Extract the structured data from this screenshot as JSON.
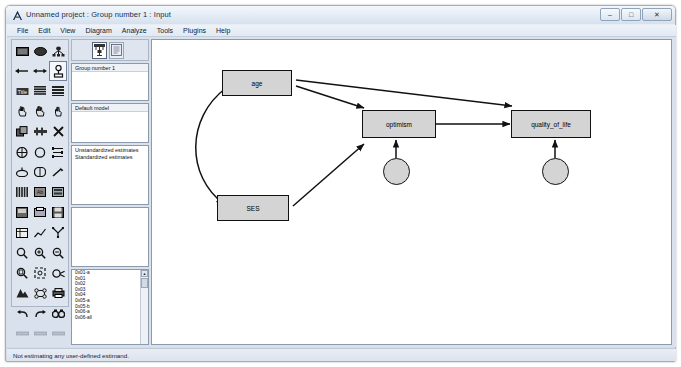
{
  "window": {
    "title": "Unnamed project : Group number 1 : Input",
    "icon": "amos-logo-icon",
    "minimize_label": "–",
    "maximize_label": "□",
    "close_label": "✕"
  },
  "menubar": {
    "items": [
      {
        "label": "File"
      },
      {
        "label": "Edit"
      },
      {
        "label": "View"
      },
      {
        "label": "Diagram"
      },
      {
        "label": "Analyze"
      },
      {
        "label": "Tools"
      },
      {
        "label": "Plugins"
      },
      {
        "label": "Help"
      }
    ]
  },
  "toolbox": {
    "tools": [
      {
        "name": "draw-observed-variable-icon",
        "selected": false
      },
      {
        "name": "draw-unobserved-variable-icon",
        "selected": false
      },
      {
        "name": "draw-latent-with-indicators-icon",
        "selected": false
      },
      {
        "name": "draw-path-icon",
        "selected": false
      },
      {
        "name": "draw-covariance-icon",
        "selected": false
      },
      {
        "name": "add-unique-variable-icon",
        "selected": true
      },
      {
        "name": "figure-caption-icon",
        "selected": false
      },
      {
        "name": "list-variables-in-model-icon",
        "selected": false
      },
      {
        "name": "list-variables-in-dataset-icon",
        "selected": false
      },
      {
        "name": "select-one-object-icon",
        "selected": false
      },
      {
        "name": "select-all-objects-icon",
        "selected": false
      },
      {
        "name": "deselect-all-objects-icon",
        "selected": false
      },
      {
        "name": "duplicate-objects-icon",
        "selected": false
      },
      {
        "name": "move-objects-icon",
        "selected": false
      },
      {
        "name": "erase-objects-icon",
        "selected": false
      },
      {
        "name": "change-shape-icon",
        "selected": false
      },
      {
        "name": "rotate-indicators-icon",
        "selected": false
      },
      {
        "name": "reflect-indicators-icon",
        "selected": false
      },
      {
        "name": "move-parameter-values-icon",
        "selected": false
      },
      {
        "name": "touch-up-variable-icon",
        "selected": false
      },
      {
        "name": "select-data-file-icon",
        "selected": false
      },
      {
        "name": "analysis-properties-icon",
        "selected": false
      },
      {
        "name": "object-properties-icon",
        "selected": false
      },
      {
        "name": "drag-properties-icon",
        "selected": false
      },
      {
        "name": "preserve-symmetries-icon",
        "selected": false
      },
      {
        "name": "zoom-icon",
        "selected": false
      },
      {
        "name": "zoom-in-icon",
        "selected": false
      },
      {
        "name": "zoom-out-icon",
        "selected": false
      },
      {
        "name": "zoom-page-icon",
        "selected": false
      },
      {
        "name": "fit-to-page-icon",
        "selected": false
      },
      {
        "name": "loupe-icon",
        "selected": false
      },
      {
        "name": "bayesian-estimation-icon",
        "selected": false
      },
      {
        "name": "multiple-group-analysis-icon",
        "selected": false
      },
      {
        "name": "print-icon",
        "selected": false
      },
      {
        "name": "undo-icon",
        "selected": false
      },
      {
        "name": "redo-icon",
        "selected": false
      },
      {
        "name": "search-icon",
        "selected": false
      }
    ]
  },
  "tree_panel": {
    "toolbar": {
      "buttons": [
        {
          "name": "view-input-path-diagram-button",
          "active": true
        },
        {
          "name": "view-output-path-diagram-button",
          "active": false
        }
      ]
    },
    "groups": {
      "items": [
        "Group number 1"
      ]
    },
    "models": {
      "items": [
        "Default model"
      ]
    },
    "estimates": {
      "items": [
        "Unstandardized estimates",
        "Standardized estimates"
      ]
    },
    "file_list": {
      "items": []
    },
    "variables": {
      "items": [
        "0x01-a",
        "0x01",
        "0x02",
        "0x03",
        "0x04",
        "0x05-a",
        "0x05-b",
        "0x06-a",
        "0x06-all"
      ],
      "scroll_up": "▲",
      "scroll_down": "▼"
    }
  },
  "diagram": {
    "nodes": [
      {
        "id": "age",
        "label": "age",
        "shape": "rect",
        "x": 215,
        "y": 103,
        "w": 70,
        "h": 26
      },
      {
        "id": "ses",
        "label": "SES",
        "shape": "rect",
        "x": 210,
        "y": 228,
        "w": 72,
        "h": 26
      },
      {
        "id": "optimism",
        "label": "optimism",
        "shape": "rect",
        "x": 355,
        "y": 170,
        "w": 72,
        "h": 28
      },
      {
        "id": "quality_of_life",
        "label": "quality_of_life",
        "shape": "rect",
        "x": 504,
        "y": 170,
        "w": 78,
        "h": 28
      },
      {
        "id": "e1",
        "label": "",
        "shape": "circle",
        "x": 375,
        "y": 222,
        "w": 27,
        "h": 27
      },
      {
        "id": "e2",
        "label": "",
        "shape": "circle",
        "x": 534,
        "y": 222,
        "w": 27,
        "h": 27
      }
    ],
    "paths": [
      {
        "from": "age",
        "to": "optimism",
        "type": "single-headed"
      },
      {
        "from": "age",
        "to": "quality_of_life",
        "type": "single-headed"
      },
      {
        "from": "ses",
        "to": "optimism",
        "type": "single-headed"
      },
      {
        "from": "optimism",
        "to": "quality_of_life",
        "type": "single-headed"
      },
      {
        "from": "age",
        "to": "ses",
        "type": "double-headed-curved"
      },
      {
        "from": "e1",
        "to": "optimism",
        "type": "single-headed"
      },
      {
        "from": "e2",
        "to": "quality_of_life",
        "type": "single-headed"
      }
    ]
  },
  "statusbar": {
    "message": "Not estimating any user-defined estimand."
  }
}
